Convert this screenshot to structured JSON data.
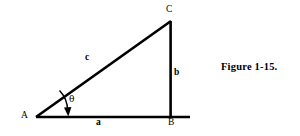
{
  "figure": {
    "caption": "Figure 1-15.",
    "background_color": "#ffffff",
    "line_color": "#000000",
    "vertices": [
      {
        "name": "A",
        "label": "A",
        "x": 36,
        "y": 117
      },
      {
        "name": "B",
        "label": "B",
        "x": 171,
        "y": 117
      },
      {
        "name": "C",
        "label": "C",
        "x": 171,
        "y": 21
      }
    ],
    "sides": [
      {
        "name": "base",
        "label": "a",
        "from": "A",
        "to": "B"
      },
      {
        "name": "vertical",
        "label": "b",
        "from": "B",
        "to": "C"
      },
      {
        "name": "hypotenuse",
        "label": "c",
        "from": "A",
        "to": "C"
      }
    ],
    "angle": {
      "name": "theta",
      "label": "θ",
      "at_vertex": "A"
    }
  }
}
